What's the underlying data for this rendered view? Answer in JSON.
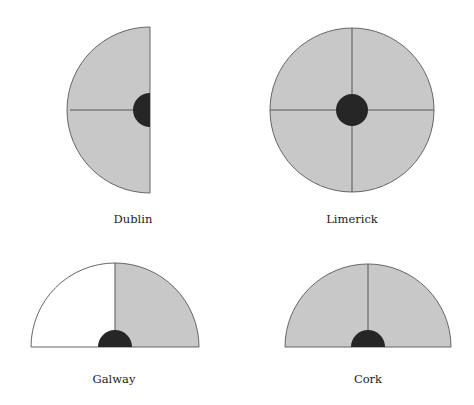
{
  "colors": {
    "fill": "#c8c8c8",
    "stroke": "#555555",
    "hub": "#262626",
    "empty": "#ffffff"
  },
  "diagrams": [
    {
      "name": "Dublin",
      "shape": "half-circle-left",
      "label_x": 133,
      "label_y": 212
    },
    {
      "name": "Limerick",
      "shape": "full-circle",
      "label_x": 352,
      "label_y": 212
    },
    {
      "name": "Galway",
      "shape": "semicircle-top, left quarter unfilled",
      "label_x": 114,
      "label_y": 372
    },
    {
      "name": "Cork",
      "shape": "semicircle-top",
      "label_x": 368,
      "label_y": 372
    }
  ]
}
